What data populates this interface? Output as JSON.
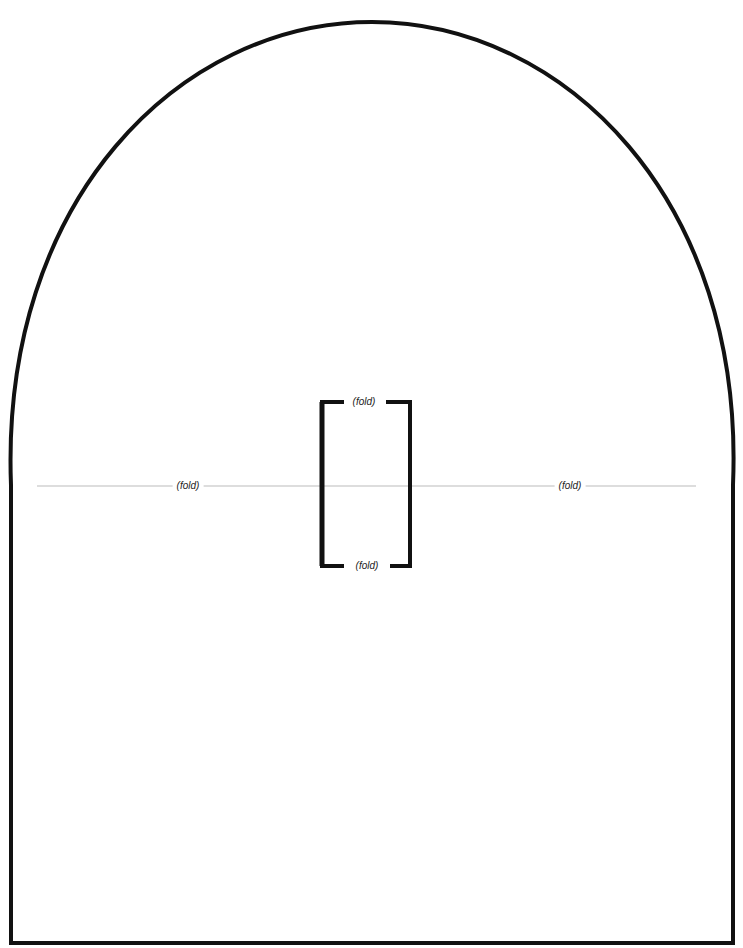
{
  "template": {
    "shape": "arch-top pattern",
    "stroke_color": "#111111",
    "fold_line_color": "#bbbbbb",
    "background": "#ffffff"
  },
  "labels": {
    "fold_left": "(fold)",
    "fold_right": "(fold)",
    "fold_bracket_top": "(fold)",
    "fold_bracket_bottom": "(fold)"
  }
}
